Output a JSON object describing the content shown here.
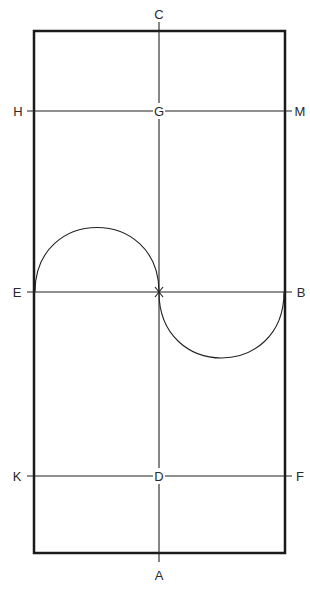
{
  "diagram": {
    "title": "",
    "colors": {
      "stroke": "#1a1a1a",
      "thin_stroke": "#222222",
      "text": "#2a2a2a",
      "background": "#ffffff"
    },
    "rectangle": {
      "x": 34,
      "y": 31,
      "width": 251,
      "height": 522
    },
    "vertical_axis": {
      "x": 159,
      "y1": 22,
      "y2": 562
    },
    "horizontal_lines": [
      {
        "name": "H-M",
        "y": 111,
        "x1": 27,
        "x2": 292
      },
      {
        "name": "E-B",
        "y": 292,
        "x1": 27,
        "x2": 292
      },
      {
        "name": "K-F",
        "y": 476,
        "x1": 27,
        "x2": 292
      }
    ],
    "center_point": {
      "label": "X",
      "x": 159,
      "y": 292
    },
    "arcs": [
      {
        "name": "upper-semicircle",
        "from": "E",
        "to": "X",
        "direction": "up",
        "peak_y": 227
      },
      {
        "name": "lower-semicircle",
        "from": "X",
        "to": "B",
        "direction": "down",
        "peak_y": 358
      }
    ],
    "labels": {
      "C": "C",
      "A": "A",
      "H": "H",
      "G": "G",
      "M": "M",
      "E": "E",
      "B": "B",
      "K": "K",
      "D": "D",
      "F": "F",
      "X": "X"
    }
  }
}
